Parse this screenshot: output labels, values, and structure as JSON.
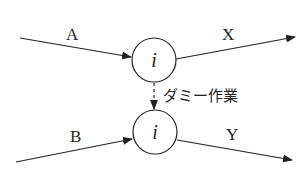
{
  "diagram": {
    "type": "activity-network",
    "nodes": [
      {
        "id": "top",
        "label": "i",
        "cx": 154,
        "cy": 60,
        "r": 22
      },
      {
        "id": "bottom",
        "label": "i",
        "cx": 155,
        "cy": 132,
        "r": 22
      }
    ],
    "edges": [
      {
        "id": "A",
        "label": "A",
        "from": "start-top",
        "to": "top",
        "style": "solid"
      },
      {
        "id": "X",
        "label": "X",
        "from": "top",
        "to": "end-top",
        "style": "solid"
      },
      {
        "id": "B",
        "label": "B",
        "from": "start-bottom",
        "to": "bottom",
        "style": "solid"
      },
      {
        "id": "Y",
        "label": "Y",
        "from": "bottom",
        "to": "end-bottom",
        "style": "solid"
      },
      {
        "id": "dummy",
        "label": "ダミー作業",
        "from": "top",
        "to": "bottom",
        "style": "dashed"
      }
    ],
    "colors": {
      "stroke": "#222222",
      "background": "#ffffff"
    }
  }
}
